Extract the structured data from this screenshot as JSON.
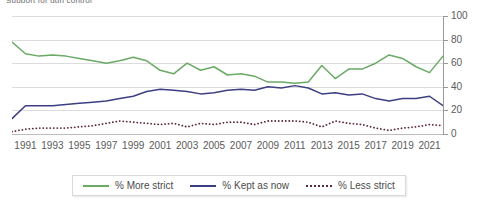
{
  "title_clipped": "Support for gun control",
  "chart_data": {
    "type": "line",
    "title": "Support for gun control",
    "xlabel": "",
    "ylabel": "",
    "ylim": [
      0,
      100
    ],
    "yticks": [
      0,
      20,
      40,
      60,
      80,
      100
    ],
    "grid": true,
    "legend_position": "bottom",
    "x": [
      1990,
      1991,
      1992,
      1993,
      1994,
      1995,
      1996,
      1997,
      1998,
      1999,
      2000,
      2001,
      2002,
      2003,
      2004,
      2005,
      2006,
      2007,
      2008,
      2009,
      2010,
      2011,
      2012,
      2013,
      2014,
      2015,
      2016,
      2017,
      2018,
      2019,
      2020,
      2021,
      2022
    ],
    "xtick_labels": [
      "1991",
      "1993",
      "1995",
      "1997",
      "1999",
      "2001",
      "2003",
      "2005",
      "2007",
      "2009",
      "2011",
      "2013",
      "2015",
      "2017",
      "2019",
      "2021"
    ],
    "series": [
      {
        "name": "% More strict",
        "color": "#6aaa64",
        "style": "solid",
        "values": [
          78,
          68,
          66,
          67,
          66,
          64,
          62,
          60,
          62,
          65,
          62,
          54,
          51,
          60,
          54,
          57,
          50,
          51,
          49,
          44,
          44,
          43,
          44,
          58,
          47,
          55,
          55,
          60,
          67,
          64,
          57,
          52,
          66
        ]
      },
      {
        "name": "% Kept as now",
        "color": "#3c3f82",
        "style": "solid",
        "values": [
          13,
          24,
          24,
          24,
          25,
          26,
          27,
          28,
          30,
          32,
          36,
          38,
          37,
          36,
          34,
          35,
          37,
          38,
          37,
          40,
          39,
          41,
          39,
          34,
          35,
          33,
          34,
          30,
          28,
          30,
          30,
          32,
          24
        ]
      },
      {
        "name": "% Less strict",
        "color": "#5b2a3d",
        "style": "dotted",
        "values": [
          2,
          4,
          5,
          5,
          5,
          6,
          7,
          9,
          11,
          10,
          9,
          8,
          9,
          6,
          9,
          8,
          10,
          10,
          8,
          11,
          11,
          11,
          10,
          6,
          11,
          9,
          8,
          5,
          3,
          5,
          6,
          8,
          7
        ]
      }
    ]
  },
  "yaxis": {
    "labels": [
      "100",
      "80",
      "60",
      "40",
      "20",
      "0"
    ]
  },
  "legend": {
    "items": [
      {
        "label": "% More strict",
        "color": "#6aaa64",
        "style": "solid"
      },
      {
        "label": "% Kept as now",
        "color": "#3c3f82",
        "style": "solid"
      },
      {
        "label": "% Less strict",
        "color": "#5b2a3d",
        "style": "dotted"
      }
    ]
  }
}
